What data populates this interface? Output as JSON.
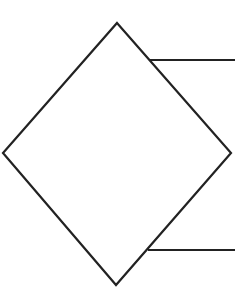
{
  "diagram": {
    "type": "flowchart-decision",
    "background": "#ffffff",
    "stroke_color": "#222222",
    "stroke_width": 2.2,
    "shapes": [
      {
        "id": "decision-diamond",
        "kind": "diamond",
        "label": "",
        "points": {
          "top": [
            117,
            23
          ],
          "right": [
            231,
            153
          ],
          "bottom": [
            116,
            285
          ],
          "left": [
            3,
            153
          ]
        }
      }
    ],
    "connectors": [
      {
        "id": "upper-branch",
        "kind": "line",
        "from": [
          150,
          60
        ],
        "to": [
          235,
          60
        ]
      },
      {
        "id": "lower-branch",
        "kind": "line",
        "from": [
          148,
          250
        ],
        "to": [
          235,
          250
        ]
      }
    ]
  }
}
